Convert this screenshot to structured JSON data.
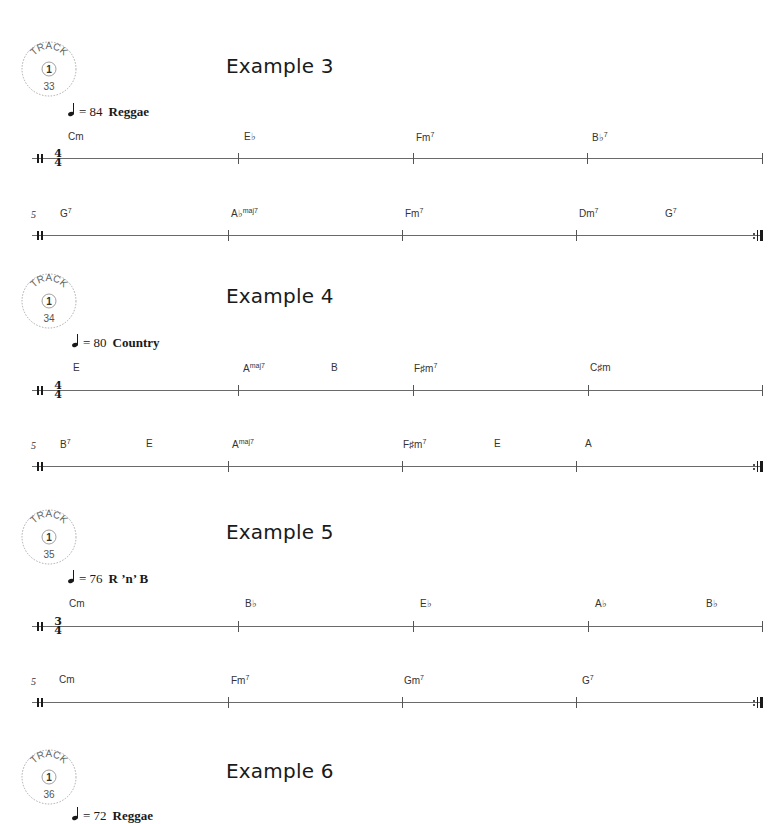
{
  "examples": [
    {
      "title": "Example 3",
      "track": {
        "label": "TRACK",
        "cd": "1",
        "number": "33"
      },
      "tempo": {
        "bpm_text": "= 84",
        "style": "Reggae"
      },
      "time_signature": {
        "top": "4",
        "bottom": "4"
      },
      "systems": [
        {
          "measure_number": "",
          "chords": [
            {
              "root": "Cm",
              "ext": ""
            },
            {
              "root": "E♭",
              "ext": ""
            },
            {
              "root": "Fm",
              "ext": "7"
            },
            {
              "root": "B♭",
              "ext": "7"
            }
          ]
        },
        {
          "measure_number": "5",
          "chords": [
            {
              "root": "G",
              "ext": "7"
            },
            {
              "root": "A♭",
              "ext": "maj7"
            },
            {
              "root": "Fm",
              "ext": "7"
            },
            {
              "root": "Dm",
              "ext": "7"
            },
            {
              "root": "G",
              "ext": "7"
            }
          ]
        }
      ]
    },
    {
      "title": "Example 4",
      "track": {
        "label": "TRACK",
        "cd": "1",
        "number": "34"
      },
      "tempo": {
        "bpm_text": "= 80",
        "style": "Country"
      },
      "time_signature": {
        "top": "4",
        "bottom": "4"
      },
      "systems": [
        {
          "measure_number": "",
          "chords": [
            {
              "root": "E",
              "ext": ""
            },
            {
              "root": "A",
              "ext": "maj7"
            },
            {
              "root": "B",
              "ext": ""
            },
            {
              "root": "F♯m",
              "ext": "7"
            },
            {
              "root": "C♯m",
              "ext": ""
            }
          ]
        },
        {
          "measure_number": "5",
          "chords": [
            {
              "root": "B",
              "ext": "7"
            },
            {
              "root": "E",
              "ext": ""
            },
            {
              "root": "A",
              "ext": "maj7"
            },
            {
              "root": "F♯m",
              "ext": "7"
            },
            {
              "root": "E",
              "ext": ""
            },
            {
              "root": "A",
              "ext": ""
            }
          ]
        }
      ]
    },
    {
      "title": "Example 5",
      "track": {
        "label": "TRACK",
        "cd": "1",
        "number": "35"
      },
      "tempo": {
        "bpm_text": "= 76",
        "style": "R ’n’ B"
      },
      "time_signature": {
        "top": "3",
        "bottom": "4"
      },
      "systems": [
        {
          "measure_number": "",
          "chords": [
            {
              "root": "Cm",
              "ext": ""
            },
            {
              "root": "B♭",
              "ext": ""
            },
            {
              "root": "E♭",
              "ext": ""
            },
            {
              "root": "A♭",
              "ext": ""
            },
            {
              "root": "B♭",
              "ext": ""
            }
          ]
        },
        {
          "measure_number": "5",
          "chords": [
            {
              "root": "Cm",
              "ext": ""
            },
            {
              "root": "Fm",
              "ext": "7"
            },
            {
              "root": "Gm",
              "ext": "7"
            },
            {
              "root": "G",
              "ext": "7"
            }
          ]
        }
      ]
    },
    {
      "title": "Example 6",
      "track": {
        "label": "TRACK",
        "cd": "1",
        "number": "36"
      },
      "tempo": {
        "bpm_text": "= 72",
        "style": "Reggae"
      }
    }
  ]
}
